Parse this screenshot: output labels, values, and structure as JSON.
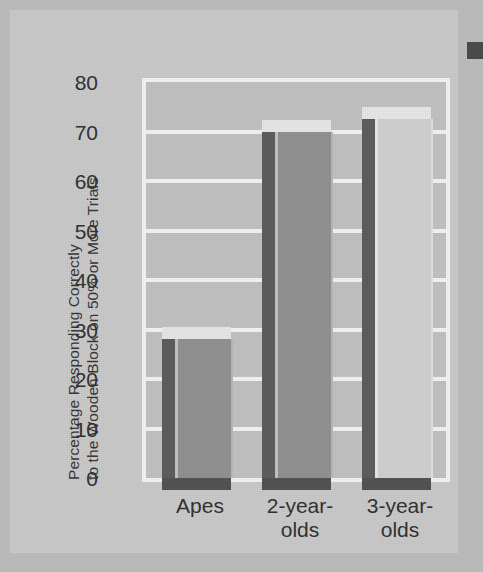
{
  "chart_data": {
    "type": "bar",
    "title": "",
    "subtitle": "",
    "xlabel": "",
    "ylabel": "Percentage Responding Correctly to the Wooden Block on 50% or More Trials",
    "ylabel_lines": [
      "Percentage Responding Correctly",
      "to the Wooden Block on 50% or More Trials"
    ],
    "categories": [
      "Apes",
      "2-year-olds",
      "3-year-olds"
    ],
    "category_lines": [
      [
        "Apes"
      ],
      [
        "2-year-",
        "olds"
      ],
      [
        "3-year-",
        "olds"
      ]
    ],
    "values": [
      28,
      70,
      72.5
    ],
    "ylim": [
      0,
      80
    ],
    "yticks": [
      0,
      10,
      20,
      30,
      40,
      50,
      60,
      70,
      80
    ],
    "ytick_labels": [
      "0",
      "10",
      "20",
      "30",
      "40",
      "50",
      "60",
      "70",
      "80"
    ],
    "grid": true,
    "grid_axis": "y",
    "legend": false,
    "legend_position": "none",
    "bar_colors": [
      "#8f8f8f",
      "#8f8f8f",
      "#cfcfcf"
    ],
    "style": "3d-shaded-bars"
  },
  "colors": {
    "page_background": "#b9b9b9",
    "sheet_background": "#c8c8c8",
    "plot_background": "#c0c0c0",
    "gridline": "#f2f2f2",
    "axis_frame": "#f2f2f2",
    "text": "#2e2e2e",
    "bar_shadow": "#5a5a5a",
    "bar_highlight": "#e6e6e6",
    "edge_artifact": "#4a4a4a"
  },
  "artifacts": {
    "right_edge_mark": "scan-edge-mark"
  }
}
